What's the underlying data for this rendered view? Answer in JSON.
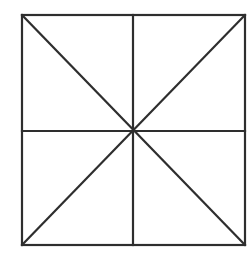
{
  "diagram": {
    "type": "geometric-figure",
    "stroke_color": "#2e2e2e",
    "background_color": "#ffffff",
    "square": {
      "x1": 22,
      "y1": 15,
      "x2": 245,
      "y2": 245
    },
    "center": {
      "x": 133,
      "y": 131
    },
    "lines": [
      {
        "name": "diagonal-main",
        "x1": 22,
        "y1": 15,
        "x2": 245,
        "y2": 245
      },
      {
        "name": "diagonal-anti",
        "x1": 245,
        "y1": 15,
        "x2": 22,
        "y2": 245
      },
      {
        "name": "vertical-midline",
        "x1": 133,
        "y1": 15,
        "x2": 133,
        "y2": 245
      },
      {
        "name": "horizontal-midline",
        "x1": 22,
        "y1": 131,
        "x2": 245,
        "y2": 131
      }
    ]
  }
}
